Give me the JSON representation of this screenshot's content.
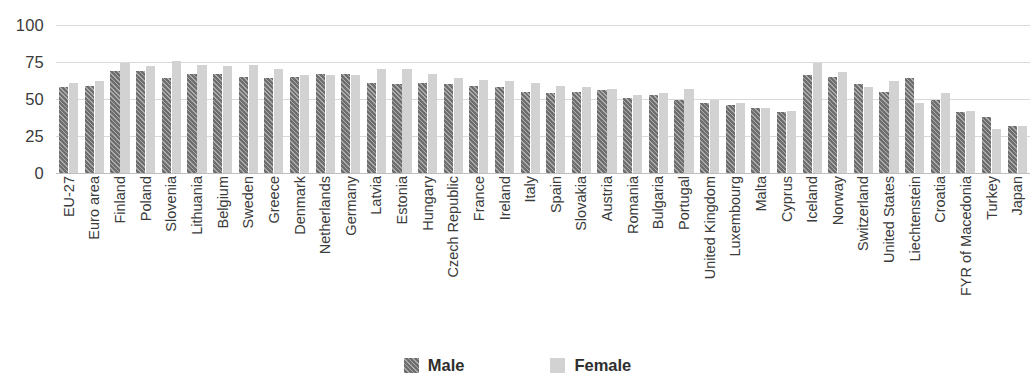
{
  "chart_data": {
    "type": "bar",
    "title": "",
    "subtitle": "",
    "xlabel": "",
    "ylabel": "",
    "ylim": [
      0,
      100
    ],
    "yticks": [
      0,
      25,
      50,
      75,
      100
    ],
    "grid": true,
    "legend_position": "bottom-center",
    "categories": [
      "EU-27",
      "Euro area",
      "Finland",
      "Poland",
      "Slovenia",
      "Lithuania",
      "Belgium",
      "Sweden",
      "Greece",
      "Denmark",
      "Netherlands",
      "Germany",
      "Latvia",
      "Estonia",
      "Hungary",
      "Czech Republic",
      "France",
      "Ireland",
      "Italy",
      "Spain",
      "Slovakia",
      "Austria",
      "Romania",
      "Bulgaria",
      "Portugal",
      "United Kingdom",
      "Luxembourg",
      "Malta",
      "Cyprus",
      "Iceland",
      "Norway",
      "Switzerland",
      "United States",
      "Liechtenstein",
      "Croatia",
      "FYR of Macedonia",
      "Turkey",
      "Japan"
    ],
    "series": [
      {
        "name": "Male",
        "color": "#6e6e6e",
        "values": [
          58,
          59,
          69,
          69,
          64,
          67,
          67,
          65,
          64,
          65,
          67,
          67,
          61,
          60,
          61,
          60,
          59,
          58,
          55,
          54,
          55,
          56,
          51,
          53,
          49,
          47,
          46,
          44,
          41,
          66,
          65,
          60,
          55,
          64,
          49,
          41,
          38,
          32
        ]
      },
      {
        "name": "Female",
        "color": "#d2d2d2",
        "values": [
          61,
          62,
          74,
          72,
          76,
          73,
          72,
          73,
          70,
          66,
          66,
          66,
          70,
          70,
          67,
          64,
          63,
          62,
          61,
          59,
          58,
          57,
          53,
          54,
          57,
          49,
          47,
          44,
          42,
          74,
          68,
          58,
          62,
          47,
          54,
          42,
          30,
          32
        ]
      }
    ],
    "legend": [
      "Male",
      "Female"
    ]
  },
  "legend": {
    "male_label": "Male",
    "female_label": "Female"
  },
  "axis": {
    "tick_0": "0",
    "tick_25": "25",
    "tick_50": "50",
    "tick_75": "75",
    "tick_100": "100"
  }
}
